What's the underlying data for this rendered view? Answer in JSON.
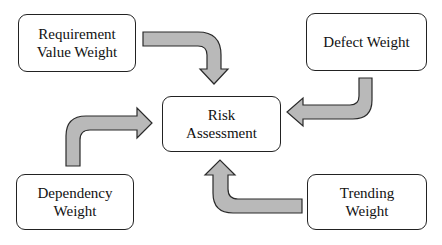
{
  "diagram": {
    "center": {
      "lines": [
        "Risk",
        "Assessment"
      ]
    },
    "inputs": [
      {
        "id": "requirement-value-weight",
        "lines": [
          "Requirement",
          "Value Weight"
        ]
      },
      {
        "id": "defect-weight",
        "lines": [
          "Defect Weight"
        ]
      },
      {
        "id": "dependency-weight",
        "lines": [
          "Dependency",
          "Weight"
        ]
      },
      {
        "id": "trending-weight",
        "lines": [
          "Trending",
          "Weight"
        ]
      }
    ],
    "edges": [
      {
        "from": "requirement-value-weight",
        "to": "risk-assessment"
      },
      {
        "from": "defect-weight",
        "to": "risk-assessment"
      },
      {
        "from": "dependency-weight",
        "to": "risk-assessment"
      },
      {
        "from": "trending-weight",
        "to": "risk-assessment"
      }
    ],
    "colors": {
      "arrow_fill": "#b9b9b9",
      "arrow_stroke": "#2a2a2a",
      "box_border": "#222222",
      "background": "#ffffff"
    }
  }
}
